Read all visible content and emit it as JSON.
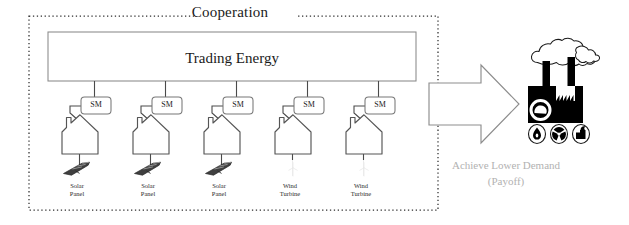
{
  "diagram": {
    "title": "Cooperation",
    "hub": {
      "label": "Trading Energy"
    },
    "meter_label": "SM",
    "prosumers": [
      {
        "meter": "SM",
        "source_line1": "Solar",
        "source_line2": "Panel",
        "icon": "solar-panel-icon"
      },
      {
        "meter": "SM",
        "source_line1": "Solar",
        "source_line2": "Panel",
        "icon": "solar-panel-icon"
      },
      {
        "meter": "SM",
        "source_line1": "Solar",
        "source_line2": "Panel",
        "icon": "solar-panel-icon"
      },
      {
        "meter": "SM",
        "source_line1": "Wind",
        "source_line2": "Turbine",
        "icon": "wind-turbine-icon"
      },
      {
        "meter": "SM",
        "source_line1": "Wind",
        "source_line2": "Turbine",
        "icon": "wind-turbine-icon"
      }
    ],
    "outcome": {
      "arrow_icon": "right-block-arrow-icon",
      "factory_icon": "polluting-factory-icon",
      "hazard_badges": [
        {
          "icon": "oil-drop-icon"
        },
        {
          "icon": "radiation-icon"
        },
        {
          "icon": "coal-plant-icon"
        }
      ],
      "payoff_line1": "Achieve Lower Demand",
      "payoff_line2": "(Payoff)"
    },
    "colors": {
      "background": "#ffffff",
      "stroke": "#4a4a4a",
      "dark_ink": "#111111",
      "factory_fill": "#000000",
      "payoff_text": "#b2b2b2",
      "dotted_border": "#333333"
    }
  }
}
